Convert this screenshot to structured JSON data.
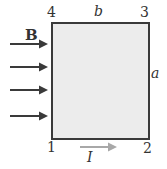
{
  "diagram": {
    "field_label": "B",
    "corner_labels": {
      "c1": "1",
      "c2": "2",
      "c3": "3",
      "c4": "4"
    },
    "side_labels": {
      "top": "b",
      "right": "a"
    },
    "current_label": "I",
    "colors": {
      "loop_fill": "#ececec",
      "loop_border": "#3a3a3a",
      "field_arrows": "#3a3a3a",
      "current_arrow": "#a8a8a8"
    },
    "field_arrow_count": 4
  }
}
